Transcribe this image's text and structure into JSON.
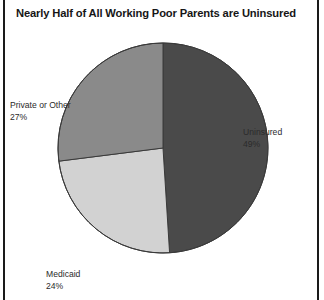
{
  "title": "Nearly Half of All Working Poor Parents are Uninsured",
  "colors": {
    "uninsured": "#4a4a4a",
    "private_or_other": "#8a8a8a",
    "medicaid": "#d2d2d2",
    "outline": "#3a3a3a",
    "text": "#2b2b2b",
    "title": "#161616",
    "frame_rule": "#1a1a1a",
    "background": "#ffffff"
  },
  "labels": {
    "uninsured": {
      "name": "Uninsured",
      "percent": "49%"
    },
    "private_or_other": {
      "name": "Private or Other",
      "percent": "27%"
    },
    "medicaid": {
      "name": "Medicaid",
      "percent": "24%"
    }
  },
  "chart_data": {
    "type": "pie",
    "title": "Nearly Half of All Working Poor Parents are Uninsured",
    "subtitle": "",
    "xlabel": "",
    "ylabel": "",
    "units": "percent",
    "total": 100,
    "start_angle_deg": 0,
    "direction": "clockwise",
    "legend": "none",
    "grid": false,
    "labels_position": "outside",
    "categories": [
      "Uninsured",
      "Medicaid",
      "Private or Other"
    ],
    "values": [
      49,
      24,
      27
    ],
    "slices": [
      {
        "label": "Uninsured",
        "value": 49,
        "value_text": "49%",
        "color": "#4a4a4a",
        "start_angle_deg": 0,
        "end_angle_deg": 176.4,
        "label_side": "right"
      },
      {
        "label": "Medicaid",
        "value": 24,
        "value_text": "24%",
        "color": "#d2d2d2",
        "start_angle_deg": 176.4,
        "end_angle_deg": 262.8,
        "label_side": "bottom-left"
      },
      {
        "label": "Private or Other",
        "value": 27,
        "value_text": "27%",
        "color": "#8a8a8a",
        "start_angle_deg": 262.8,
        "end_angle_deg": 360.0,
        "label_side": "top-left"
      }
    ],
    "geometry": {
      "center_x": 163,
      "center_y": 122,
      "radius": 105
    }
  }
}
